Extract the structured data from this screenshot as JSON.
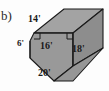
{
  "figure": {
    "part_label": "b)",
    "shape_name": "trapezoidal-prism",
    "fill_color": "#9a9a9a",
    "fill_color_light": "#a5a5a5",
    "fill_color_dark": "#8f8f8f",
    "stroke_color": "#1a1a1a",
    "background_color": "#fdfdfd",
    "labels": {
      "top_slant": "14'",
      "left_vertical": "6'",
      "middle_horizontal": "16'",
      "right_vertical": "18'",
      "bottom_slant": "20'"
    },
    "right_angle_markers": 2,
    "units": "feet"
  }
}
